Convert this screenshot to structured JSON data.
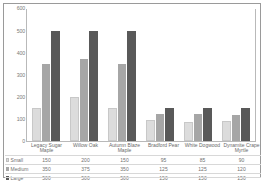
{
  "chart_data": {
    "type": "bar",
    "title": "",
    "xlabel": "",
    "ylabel": "",
    "ylim": [
      0,
      600
    ],
    "yticks": [
      600,
      500,
      400,
      300,
      200,
      100,
      0
    ],
    "grid": false,
    "legend_position": "table-left",
    "categories": [
      "Legacy Sugar Maple",
      "Willow Oak",
      "Autumn Blaze Maple",
      "Bradford Pear",
      "White Dogwood",
      "Dynamite Crape Myrtle"
    ],
    "series": [
      {
        "name": "Small",
        "color": "#dcdcdc",
        "values": [
          150,
          200,
          150,
          95,
          85,
          90
        ]
      },
      {
        "name": "Medium",
        "color": "#a6a6a6",
        "values": [
          350,
          375,
          350,
          125,
          125,
          120
        ]
      },
      {
        "name": "Large",
        "color": "#595959",
        "values": [
          500,
          500,
          500,
          150,
          150,
          150
        ]
      }
    ]
  },
  "table": {
    "corner_label": ""
  }
}
